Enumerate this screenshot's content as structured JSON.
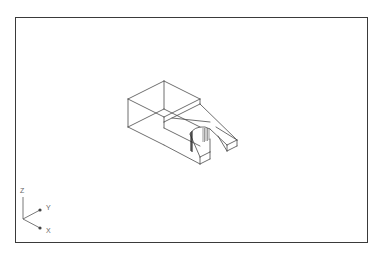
{
  "viewport": {
    "frame": {
      "x": 15,
      "y": 17,
      "width": 353,
      "height": 226
    },
    "border_color": "#3a3a3a"
  },
  "model": {
    "name": "fork-bracket-wireframe",
    "stroke_color": "#4a4a4a",
    "edges": [
      [
        128,
        99,
        164,
        81
      ],
      [
        164,
        81,
        200,
        99
      ],
      [
        128,
        99,
        164,
        117
      ],
      [
        164,
        117,
        200,
        99
      ],
      [
        128,
        99,
        128,
        127
      ],
      [
        164,
        81,
        164,
        109
      ],
      [
        128,
        127,
        164,
        145
      ],
      [
        128,
        127,
        164,
        109
      ],
      [
        164,
        109,
        200,
        127
      ],
      [
        200,
        99,
        200,
        104
      ],
      [
        164,
        117,
        164,
        122
      ],
      [
        164,
        122,
        200,
        104
      ],
      [
        164,
        122,
        164,
        128
      ],
      [
        164,
        128,
        200,
        146
      ],
      [
        200,
        104,
        237,
        140
      ],
      [
        172,
        118,
        210,
        122
      ],
      [
        164,
        145,
        200,
        164
      ],
      [
        200,
        164,
        210,
        159
      ],
      [
        200,
        157,
        200,
        164
      ],
      [
        200,
        157,
        210,
        152
      ],
      [
        210,
        152,
        210,
        159
      ],
      [
        190,
        134,
        200,
        157
      ],
      [
        210,
        152,
        210,
        139
      ],
      [
        227,
        145,
        227,
        151
      ],
      [
        227,
        151,
        237,
        146
      ],
      [
        237,
        140,
        237,
        146
      ],
      [
        227,
        145,
        237,
        140
      ],
      [
        210,
        129,
        227,
        145
      ],
      [
        216,
        127,
        237,
        140
      ],
      [
        218,
        136,
        227,
        151
      ]
    ],
    "dark_edges": [
      [
        191,
        132,
        191,
        151
      ],
      [
        192,
        131,
        192,
        152
      ]
    ],
    "slot_arc": "M190,134 Q194,126 205,127 L210,129",
    "hatch_lines": [
      [
        203,
        128,
        203,
        142
      ],
      [
        204.5,
        128,
        204.5,
        142
      ],
      [
        206,
        128,
        206,
        141
      ],
      [
        207.5,
        128,
        207.5,
        141
      ],
      [
        209,
        129,
        209,
        140
      ]
    ]
  },
  "ucs_icon": {
    "origin": {
      "x": 23,
      "y": 219
    },
    "axes": [
      {
        "label": "Z",
        "x2": 23,
        "y2": 197,
        "label_x": 20,
        "label_y": 193
      },
      {
        "label": "Y",
        "x2": 40,
        "y2": 210,
        "label_x": 46,
        "label_y": 210
      },
      {
        "label": "X",
        "x2": 40,
        "y2": 228,
        "label_x": 46,
        "label_y": 233
      }
    ]
  }
}
